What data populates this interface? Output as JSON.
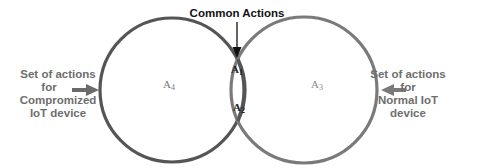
{
  "diagram": {
    "type": "venn",
    "title": "Common Actions",
    "sets": [
      {
        "id": "compromized",
        "region_label": "A",
        "region_sub": "4",
        "description_lines": [
          "Set of actions",
          "for",
          "Compromized",
          "IoT device"
        ],
        "stroke_color": "#555555"
      },
      {
        "id": "normal",
        "region_label": "A",
        "region_sub": "3",
        "description_lines": [
          "Set of actions",
          "for",
          "Normal IoT",
          "device"
        ],
        "stroke_color": "#7a7a7a"
      }
    ],
    "intersection": {
      "label": "Common Actions",
      "regions": [
        {
          "label": "A",
          "sub": "1"
        },
        {
          "label": "A",
          "sub": "2"
        }
      ]
    },
    "colors": {
      "left_circle": "#555555",
      "right_circle": "#7a7a7a",
      "label_text": "#6e6e6e",
      "arrow_left": "#6a6a6a",
      "arrow_right": "#7a7a7a",
      "common_arrow": "#111111"
    }
  }
}
